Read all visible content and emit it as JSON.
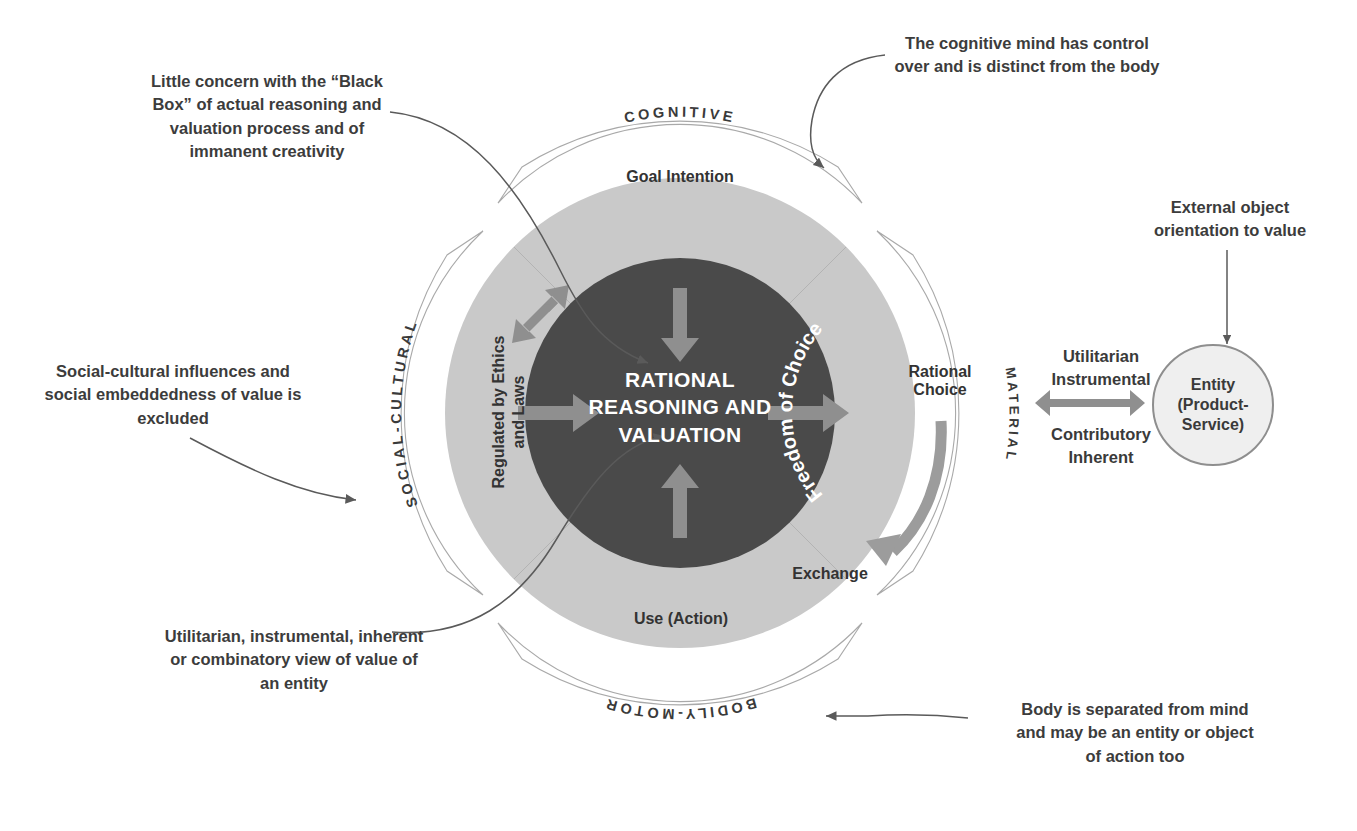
{
  "diagram": {
    "core": {
      "text": "RATIONAL\nREASONING AND\nVALUATION",
      "color": "#4a4a4a",
      "text_color": "#ffffff"
    },
    "ring": {
      "color": "#c9c9c9",
      "labels": [
        {
          "id": "goal-intention",
          "text": "Goal Intention"
        },
        {
          "id": "regulated-ethics-laws",
          "text": "Regulated by Ethics\nand Laws"
        },
        {
          "id": "freedom-of-choice",
          "text": "Freedom of Choice"
        },
        {
          "id": "rational-choice",
          "text": "Rational\nChoice"
        },
        {
          "id": "exchange",
          "text": "Exchange"
        },
        {
          "id": "use-action",
          "text": "Use (Action)"
        }
      ]
    },
    "outer_sectors": [
      {
        "id": "cognitive",
        "text": "COGNITIVE"
      },
      {
        "id": "material",
        "text": "MATERIAL"
      },
      {
        "id": "bodily-motor",
        "text": "BODILY-MOTOR"
      },
      {
        "id": "social-cultural",
        "text": "SOCIAL-CULTURAL"
      }
    ],
    "entity": {
      "text": "Entity\n(Product-\nService)"
    },
    "exchange_axis": {
      "above": "Utilitarian\nInstrumental",
      "below": "Contributory\nInherent"
    },
    "annotations": [
      {
        "id": "black-box",
        "text": "Little concern with the “Black\nBox” of actual reasoning and\nvaluation process and of\nimmanent creativity"
      },
      {
        "id": "cognitive-mind-control",
        "text": "The cognitive mind has control\nover and is distinct from the body"
      },
      {
        "id": "external-object-orientation",
        "text": "External object\norientation to value"
      },
      {
        "id": "social-cultural-excluded",
        "text": "Social-cultural influences and\nsocial embeddedness of value is\nexcluded"
      },
      {
        "id": "utilitarian-view",
        "text": "Utilitarian, instrumental, inherent\nor combinatory view of value of\nan entity"
      },
      {
        "id": "body-separated",
        "text": "Body is separated from mind\nand may be an entity or object\nof action too"
      }
    ],
    "colors": {
      "background": "#ffffff",
      "inner_circle": "#4a4a4a",
      "ring": "#c9c9c9",
      "arrow": "#8d8d8d",
      "ring_arrow": "#aeaeae",
      "outline": "#9a9a9a",
      "text": "#3a3a3a"
    }
  }
}
